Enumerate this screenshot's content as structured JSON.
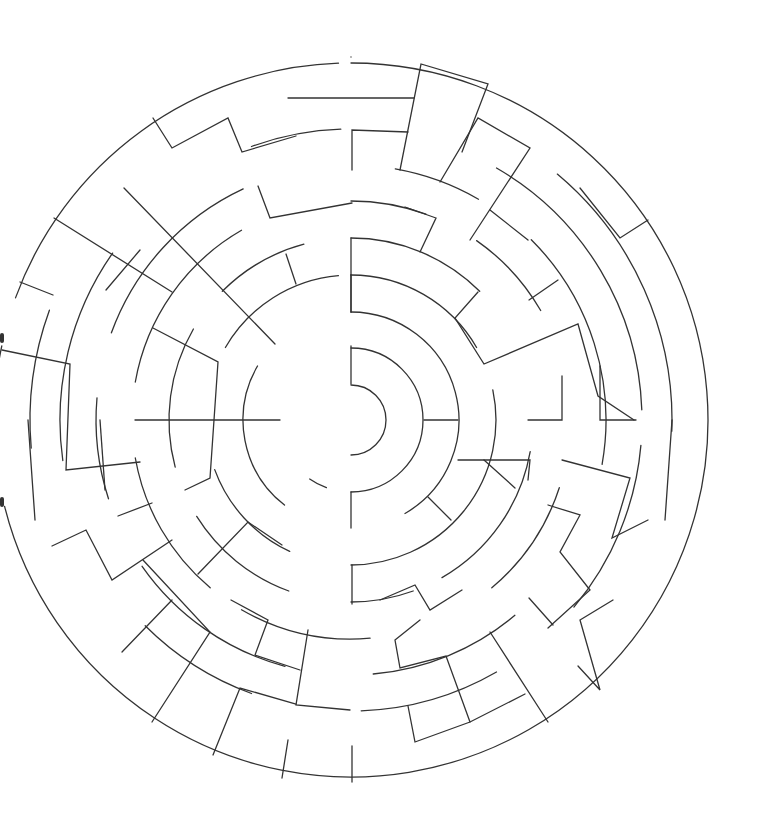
{
  "puzzle": {
    "type": "circular-maze",
    "title": "",
    "wall_color": "#333333",
    "background_color": "#ffffff",
    "ring_count": 8,
    "openings": [
      "entrance-left-upper",
      "exit-left-lower"
    ]
  }
}
